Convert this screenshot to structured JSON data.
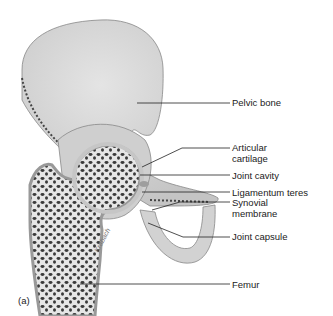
{
  "figure": {
    "panel_label": "(a)",
    "signature": "Krabach",
    "colors": {
      "bone": "#d9d9d9",
      "bone_shade": "#bdbdbd",
      "spongy": "#3a3a3a",
      "cartilage": "#c8c8c8",
      "line": "#222222"
    }
  },
  "labels": [
    {
      "id": "pelvic-bone",
      "text": "Pelvic bone"
    },
    {
      "id": "articular-cartilage",
      "text": "Articular\ncartilage",
      "line1": "Articular",
      "line2": "cartilage"
    },
    {
      "id": "joint-cavity",
      "text": "Joint cavity"
    },
    {
      "id": "ligamentum-teres",
      "text": "Ligamentum teres"
    },
    {
      "id": "synovial-membrane",
      "text": "Synovial\nmembrane",
      "line1": "Synovial",
      "line2": "membrane"
    },
    {
      "id": "joint-capsule",
      "text": "Joint capsule"
    },
    {
      "id": "femur",
      "text": "Femur"
    }
  ]
}
